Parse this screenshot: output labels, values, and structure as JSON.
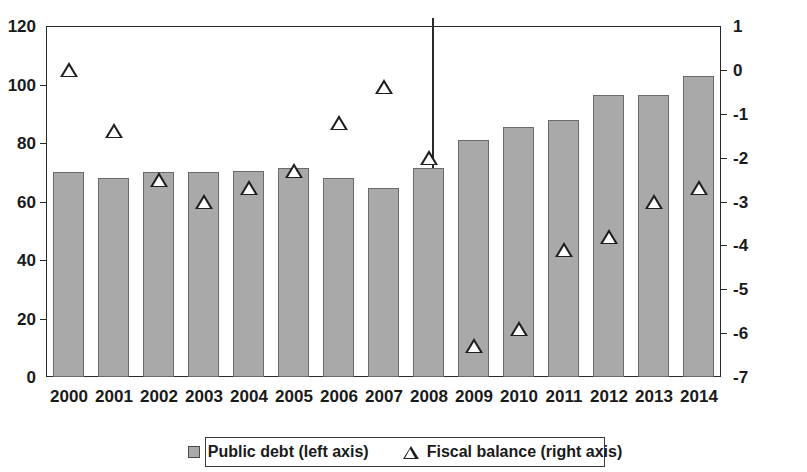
{
  "chart_data": {
    "type": "bar",
    "title": "",
    "subtitle": "",
    "xlabel": "",
    "categories": [
      "2000",
      "2001",
      "2002",
      "2003",
      "2004",
      "2005",
      "2006",
      "2007",
      "2008",
      "2009",
      "2010",
      "2011",
      "2012",
      "2013",
      "2014"
    ],
    "grid": false,
    "legend_position": "bottom",
    "annotations": [
      {
        "name": "forecast-divider",
        "type": "vertical-line",
        "between": [
          "2007",
          "2008"
        ]
      }
    ],
    "axes": {
      "left": {
        "label": "Public debt (left axis)",
        "ylim": [
          0,
          120
        ],
        "ticks": [
          0,
          20,
          40,
          60,
          80,
          100,
          120
        ],
        "tick_labels": [
          "0",
          "20",
          "40",
          "60",
          "80",
          "100",
          "120"
        ]
      },
      "right": {
        "label": "Fiscal balance (right axis)",
        "ylim": [
          -7,
          1
        ],
        "ticks": [
          1,
          0,
          -1,
          -2,
          -3,
          -4,
          -5,
          -6,
          -7
        ],
        "tick_labels": [
          "1",
          "0",
          "-1",
          "-2",
          "-3",
          "-4",
          "-5",
          "-6",
          "-7"
        ]
      }
    },
    "series": [
      {
        "name": "Public debt (left axis)",
        "type": "bar",
        "axis": "left",
        "color": "#a9a9a9",
        "edge_color": "#6b6b6b",
        "values": [
          70.0,
          68.0,
          70.0,
          70.0,
          70.5,
          71.5,
          68.0,
          64.5,
          71.5,
          81.0,
          85.5,
          88.0,
          96.5,
          96.5,
          103.0
        ]
      },
      {
        "name": "Fiscal balance (right axis)",
        "type": "scatter",
        "axis": "right",
        "marker": "triangle-up-open",
        "color": "#ffffff",
        "edge_color": "#1f1f1f",
        "values": [
          0.0,
          -1.4,
          -2.5,
          -3.0,
          -2.7,
          -2.3,
          -1.2,
          -0.4,
          -2.0,
          -6.3,
          -5.9,
          -4.1,
          -3.8,
          -3.0,
          -2.7
        ]
      }
    ]
  },
  "legend": {
    "items": [
      {
        "label": "Public debt (left axis)",
        "marker": "square-icon"
      },
      {
        "label": "Fiscal balance (right axis)",
        "marker": "triangle-icon"
      }
    ]
  }
}
